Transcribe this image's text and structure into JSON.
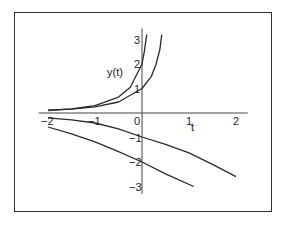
{
  "chart_data": {
    "type": "line",
    "title": "",
    "xlabel": "t",
    "ylabel": "y(t)",
    "xlim": [
      -2.2,
      2.25
    ],
    "ylim": [
      -3.3,
      3.45
    ],
    "grid": false,
    "legend": null,
    "xticks": [
      -2,
      -1,
      0,
      1,
      2
    ],
    "yticks": [
      -3,
      -2,
      -1,
      1,
      2,
      3
    ],
    "colors": {
      "curve": "#2a2a2a",
      "axis": "#444444",
      "frame": "#333333"
    },
    "series": [
      {
        "name": "solution y(0)=2",
        "x": [
          -2,
          -1.5,
          -1,
          -0.5,
          -0.25,
          0,
          0.05,
          0.1
        ],
        "y": [
          0.1,
          0.17,
          0.3,
          0.65,
          1.05,
          2.0,
          2.5,
          3.2
        ]
      },
      {
        "name": "solution y(0)=1",
        "x": [
          -2,
          -1.5,
          -1,
          -0.5,
          0,
          0.2,
          0.3,
          0.38,
          0.42
        ],
        "y": [
          0.12,
          0.16,
          0.25,
          0.45,
          1.0,
          1.5,
          2.0,
          2.6,
          3.2
        ]
      },
      {
        "name": "solution y(0)=-1",
        "x": [
          -2,
          -1.5,
          -1,
          -0.5,
          0,
          0.5,
          1,
          1.5,
          2
        ],
        "y": [
          -0.2,
          -0.28,
          -0.41,
          -0.65,
          -0.98,
          -1.28,
          -1.63,
          -2.1,
          -2.6
        ]
      },
      {
        "name": "solution y(0)=-2",
        "x": [
          -2,
          -1.5,
          -1,
          -0.5,
          0,
          0.5,
          1.1
        ],
        "y": [
          -0.57,
          -0.85,
          -1.18,
          -1.58,
          -2.0,
          -2.48,
          -3.0
        ]
      }
    ]
  },
  "labels": {
    "y_axis": "y(t)",
    "x_axis": "t",
    "origin": "0"
  }
}
